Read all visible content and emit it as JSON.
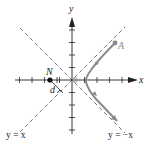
{
  "figure": {
    "type": "hyperbola-diagram",
    "axis_labels": {
      "x": "x",
      "y": "y"
    },
    "asymptote_labels": {
      "left": "y = x",
      "right": "y = −x"
    },
    "points": {
      "N": {
        "label": "N"
      },
      "A": {
        "label": "A"
      }
    },
    "distance_label": "d",
    "colors": {
      "axis": "#222222",
      "asymptote": "#555555",
      "curve": "#8a8a8a",
      "point_N": "#111111",
      "point_A": "#8a8a8a"
    }
  }
}
